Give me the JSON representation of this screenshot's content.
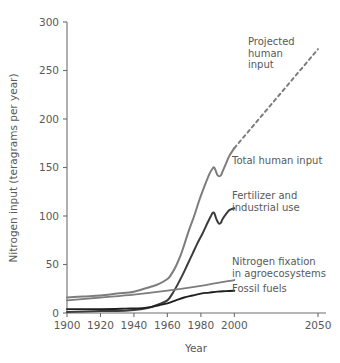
{
  "chart_data": {
    "type": "line",
    "title": "",
    "xlabel": "Year",
    "ylabel": "Nitrogen input (teragrams per year)",
    "xlim": [
      1900,
      2055
    ],
    "ylim": [
      0,
      300
    ],
    "xticks": [
      1900,
      1920,
      1940,
      1960,
      1980,
      2000,
      2050
    ],
    "xtick_labels": [
      "1900",
      "1920",
      "1940",
      "1960",
      "1980",
      "2000",
      "2050"
    ],
    "yticks": [
      0,
      50,
      100,
      150,
      200,
      250,
      300
    ],
    "ytick_labels": [
      "0",
      "50",
      "100",
      "150",
      "200",
      "250",
      "300"
    ],
    "grid": false,
    "legend": "annotations-on-curves",
    "series": [
      {
        "name": "Total human input",
        "color": "#7d7d7d",
        "width": 2.0,
        "style": "solid",
        "label": "Total human input",
        "label_x": 232,
        "label_y": 164,
        "x": [
          1900,
          1910,
          1920,
          1930,
          1940,
          1950,
          1955,
          1960,
          1962,
          1965,
          1968,
          1970,
          1973,
          1976,
          1979,
          1982,
          1985,
          1987,
          1988,
          1989,
          1990,
          1991,
          1992,
          1993,
          1995,
          1997,
          2000
        ],
        "y": [
          16,
          17,
          18,
          20,
          22,
          27,
          30,
          35,
          39,
          48,
          60,
          70,
          86,
          100,
          116,
          130,
          143,
          149,
          150,
          146,
          142,
          141,
          142,
          146,
          154,
          162,
          170
        ]
      },
      {
        "name": "Projected human input",
        "color": "#7d7d7d",
        "width": 2.0,
        "style": "dashed",
        "label": "Projected\nhuman\ninput",
        "label_lines": [
          "Projected",
          "human",
          "input"
        ],
        "label_x": 248,
        "label_y": 45,
        "x": [
          2000,
          2050
        ],
        "y": [
          170,
          272
        ]
      },
      {
        "name": "Fertilizer and industrial use",
        "color": "#3c3c3c",
        "width": 2.0,
        "style": "solid",
        "label_lines": [
          "Fertilizer and",
          "industrial use"
        ],
        "label_x": 232,
        "label_y": 199,
        "x": [
          1900,
          1920,
          1930,
          1940,
          1945,
          1950,
          1955,
          1960,
          1963,
          1966,
          1969,
          1972,
          1975,
          1978,
          1981,
          1984,
          1986,
          1987,
          1988,
          1989,
          1990,
          1991,
          1992,
          1993,
          1995,
          1997,
          2000
        ],
        "y": [
          1,
          2,
          2,
          3,
          4,
          6,
          9,
          13,
          20,
          29,
          39,
          50,
          61,
          72,
          82,
          93,
          100,
          103,
          103,
          98,
          94,
          92,
          93,
          97,
          102,
          106,
          108
        ]
      },
      {
        "name": "Nitrogen fixation in agroecosystems",
        "color": "#7d7d7d",
        "width": 1.8,
        "style": "solid",
        "label_lines": [
          "Nitrogen fixation",
          "in agroecosystems"
        ],
        "label_x": 232,
        "label_y": 265,
        "x": [
          1900,
          1920,
          1940,
          1960,
          1980,
          2000
        ],
        "y": [
          13,
          16,
          19,
          23,
          28,
          34
        ]
      },
      {
        "name": "Fossil fuels",
        "color": "#1f1f1f",
        "width": 1.9,
        "style": "solid",
        "label": "Fossil fuels",
        "label_x": 232,
        "label_y": 292,
        "x": [
          1900,
          1920,
          1935,
          1945,
          1950,
          1955,
          1960,
          1965,
          1970,
          1975,
          1980,
          1985,
          1990,
          1995,
          2000
        ],
        "y": [
          4,
          4,
          4.5,
          5,
          6,
          8,
          10,
          13,
          16,
          18,
          20,
          21,
          22,
          22.5,
          23
        ]
      }
    ],
    "annotations": [
      "Projected human input",
      "Total human input",
      "Fertilizer and industrial use",
      "Nitrogen fixation in agroecosystems",
      "Fossil fuels"
    ]
  }
}
